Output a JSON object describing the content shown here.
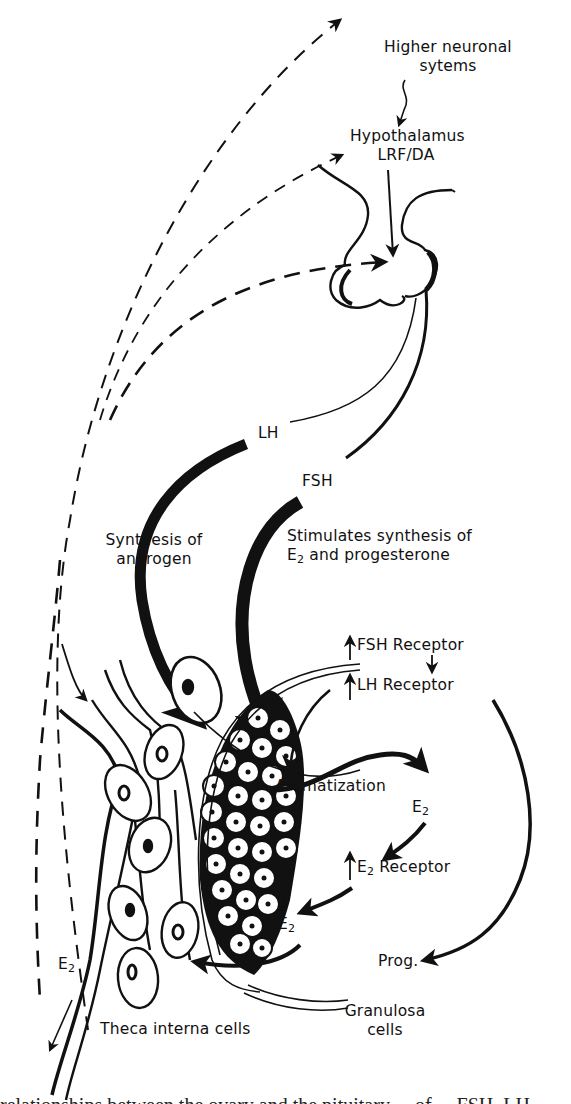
{
  "diagram": {
    "type": "endocrine feedback schematic",
    "nodes": {
      "higher_neuronal": {
        "line1": "Higher neuronal",
        "line2": "sytems"
      },
      "hypothalamus": {
        "line1": "Hypothalamus",
        "line2": "LRF/DA"
      },
      "pituitary": {
        "label": ""
      },
      "lh": {
        "label": "LH"
      },
      "fsh": {
        "label": "FSH"
      },
      "synthesis_androgen": {
        "line1": "Synthesis of",
        "line2": "androgen"
      },
      "stimulates_synthesis": {
        "line1": "Stimulates synthesis of",
        "line2_prefix": "E",
        "line2_sub": "2",
        "line2_suffix": " and progesterone"
      },
      "fsh_receptor": {
        "label": "FSH  Receptor"
      },
      "lh_receptor": {
        "label": "LH  Receptor"
      },
      "aromatization": {
        "label": "Aromatization"
      },
      "e2_top": {
        "base": "E",
        "sub": "2"
      },
      "e2_receptor": {
        "base": "E",
        "sub": "2",
        "suffix": "  Receptor"
      },
      "e2_mid": {
        "base": "E",
        "sub": "2"
      },
      "e2_left": {
        "base": "E",
        "sub": "2"
      },
      "prog": {
        "label": "Prog."
      },
      "granulosa": {
        "line1": "Granulosa",
        "line2": "cells"
      },
      "theca": {
        "label": "Theca interna cells"
      }
    },
    "edges": [
      {
        "from": "ovary",
        "to": "higher_neuronal",
        "style": "dashed"
      },
      {
        "from": "ovary",
        "to": "hypothalamus",
        "style": "dashed"
      },
      {
        "from": "ovary",
        "to": "pituitary",
        "style": "dashed"
      },
      {
        "from": "higher_neuronal",
        "to": "hypothalamus",
        "style": "solid"
      },
      {
        "from": "hypothalamus",
        "to": "pituitary",
        "style": "solid"
      },
      {
        "from": "pituitary",
        "to": "theca",
        "label": "LH",
        "style": "bold"
      },
      {
        "from": "pituitary",
        "to": "granulosa",
        "label": "FSH",
        "style": "bold"
      },
      {
        "from": "theca",
        "to": "granulosa",
        "label": "Aromatization",
        "style": "bold"
      },
      {
        "from": "e2_top",
        "to": "e2_receptor",
        "style": "bold"
      },
      {
        "from": "e2_receptor",
        "to": "e2_mid",
        "style": "bold"
      },
      {
        "from": "lh_receptor",
        "to": "prog",
        "style": "bold"
      },
      {
        "from": "granulosa",
        "to": "theca",
        "style": "bold"
      }
    ],
    "colors": {
      "ink": "#111111",
      "background": "#ffffff"
    }
  },
  "caption": {
    "text": "relationships between the ovary and the pituitary ... of ... FSH, LH"
  }
}
